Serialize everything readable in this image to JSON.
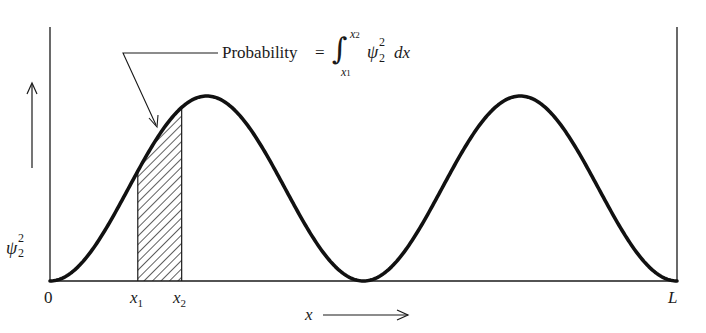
{
  "figure": {
    "origin_label": "0",
    "end_label": "L",
    "x_axis_label": "x",
    "y_axis_label": {
      "symbol": "ψ",
      "superscript": "2",
      "subscript": "2"
    },
    "x1_label": {
      "symbol": "x",
      "subscript": "1"
    },
    "x2_label": {
      "symbol": "x",
      "subscript": "2"
    },
    "annotation": {
      "text": "Probability",
      "equals": "=",
      "integral_sign": "∫",
      "upper_limit": {
        "symbol": "x",
        "subscript": "2"
      },
      "lower_limit": {
        "symbol": "x",
        "subscript": "1"
      },
      "integrand": {
        "symbol": "ψ",
        "superscript": "2",
        "subscript": "2"
      },
      "differential": "dx"
    },
    "colors": {
      "ink": "#1a1a1a",
      "background": "#ffffff"
    }
  },
  "chart_data": {
    "type": "line",
    "title": "",
    "function": "psi_2^2 = sin^2(2*pi*x/L)",
    "xlabel": "x",
    "ylabel": "ψ₂²",
    "x_range": [
      0,
      1
    ],
    "y_range": [
      0,
      1
    ],
    "x": [
      0,
      0.125,
      0.25,
      0.375,
      0.5,
      0.625,
      0.75,
      0.875,
      1.0
    ],
    "values": [
      0,
      0.5,
      1.0,
      0.5,
      0,
      0.5,
      1.0,
      0.5,
      0
    ],
    "shaded_region": {
      "x1": 0.14,
      "x2": 0.21,
      "label": "Probability"
    },
    "grid": false,
    "legend": null
  }
}
